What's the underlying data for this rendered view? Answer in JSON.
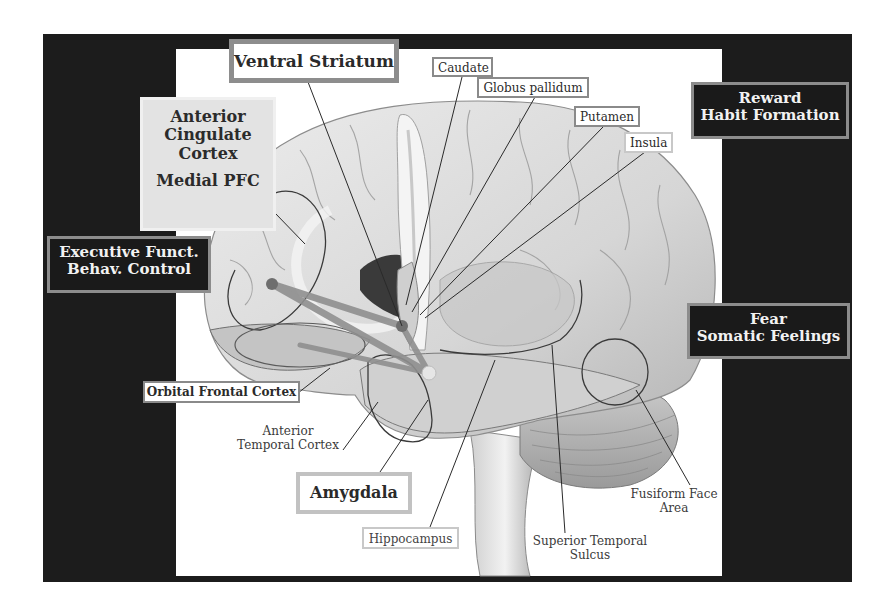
{
  "diagram": {
    "colors": {
      "frame": "#1c1c1c",
      "panel": "#ffffff",
      "brain_fill": "#d9d9d9",
      "pathway": "#8f8f8f",
      "dot": "#6e6e6e",
      "label_border": "#8a8a8a"
    },
    "function_labels": {
      "reward": [
        "Reward",
        "Habit Formation"
      ],
      "fear": [
        "Fear",
        "Somatic Feelings"
      ],
      "executive": [
        "Executive Funct.",
        "Behav. Control"
      ]
    },
    "region_labels": {
      "ventral_striatum": "Ventral Striatum",
      "acc": [
        "Anterior",
        "Cingulate",
        "Cortex"
      ],
      "medial_pfc": "Medial PFC",
      "caudate": "Caudate",
      "globus_pallidum": "Globus pallidum",
      "putamen": "Putamen",
      "insula": "Insula",
      "orbital_frontal": "Orbital Frontal Cortex",
      "anterior_temporal": [
        "Anterior",
        "Temporal Cortex"
      ],
      "amygdala": "Amygdala",
      "hippocampus": "Hippocampus",
      "sts": [
        "Superior Temporal",
        "Sulcus"
      ],
      "ffa": [
        "Fusiform Face",
        "Area"
      ]
    }
  }
}
